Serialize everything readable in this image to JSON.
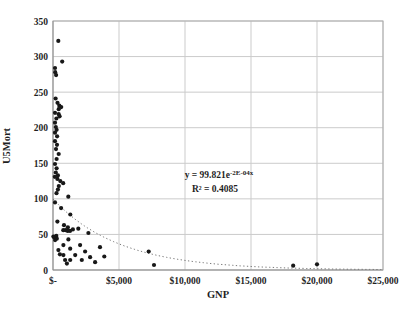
{
  "chart_data": {
    "type": "scatter",
    "title": "",
    "xlabel": "GNP",
    "ylabel": "U5Mort",
    "xlim": [
      0,
      25000
    ],
    "ylim": [
      0,
      350
    ],
    "grid": true,
    "legend": "none",
    "x_ticks": [
      {
        "value": 0,
        "label": "$-"
      },
      {
        "value": 5000,
        "label": "$5,000"
      },
      {
        "value": 10000,
        "label": "$10,000"
      },
      {
        "value": 15000,
        "label": "$15,000"
      },
      {
        "value": 20000,
        "label": "$20,000"
      },
      {
        "value": 25000,
        "label": "$25,000"
      }
    ],
    "y_ticks": [
      {
        "value": 0,
        "label": "0"
      },
      {
        "value": 50,
        "label": "50"
      },
      {
        "value": 100,
        "label": "100"
      },
      {
        "value": 150,
        "label": "150"
      },
      {
        "value": 200,
        "label": "200"
      },
      {
        "value": 250,
        "label": "250"
      },
      {
        "value": 300,
        "label": "300"
      },
      {
        "value": 350,
        "label": "350"
      }
    ],
    "points": [
      [
        400,
        322
      ],
      [
        700,
        293
      ],
      [
        150,
        284
      ],
      [
        165,
        278
      ],
      [
        235,
        274
      ],
      [
        200,
        241
      ],
      [
        340,
        235
      ],
      [
        480,
        231
      ],
      [
        620,
        229
      ],
      [
        430,
        226
      ],
      [
        150,
        221
      ],
      [
        430,
        219
      ],
      [
        500,
        216
      ],
      [
        260,
        213
      ],
      [
        150,
        207
      ],
      [
        210,
        201
      ],
      [
        270,
        197
      ],
      [
        150,
        193
      ],
      [
        310,
        188
      ],
      [
        150,
        181
      ],
      [
        300,
        176
      ],
      [
        230,
        170
      ],
      [
        430,
        163
      ],
      [
        270,
        156
      ],
      [
        150,
        149
      ],
      [
        270,
        143
      ],
      [
        210,
        137
      ],
      [
        370,
        133
      ],
      [
        140,
        131
      ],
      [
        330,
        128
      ],
      [
        550,
        125
      ],
      [
        770,
        122
      ],
      [
        440,
        118
      ],
      [
        370,
        113
      ],
      [
        265,
        108
      ],
      [
        1160,
        103
      ],
      [
        150,
        95
      ],
      [
        610,
        87
      ],
      [
        1310,
        78
      ],
      [
        330,
        68
      ],
      [
        830,
        63
      ],
      [
        1130,
        60
      ],
      [
        1510,
        57
      ],
      [
        780,
        56
      ],
      [
        960,
        56
      ],
      [
        1110,
        55
      ],
      [
        1290,
        55
      ],
      [
        1920,
        58
      ],
      [
        2680,
        52
      ],
      [
        250,
        48
      ],
      [
        100,
        46
      ],
      [
        290,
        44
      ],
      [
        160,
        42
      ],
      [
        1170,
        43
      ],
      [
        30,
        47
      ],
      [
        520,
        22
      ],
      [
        790,
        35
      ],
      [
        2050,
        35
      ],
      [
        1300,
        30
      ],
      [
        410,
        28
      ],
      [
        2430,
        26
      ],
      [
        3560,
        32
      ],
      [
        790,
        21
      ],
      [
        1680,
        21
      ],
      [
        2810,
        18
      ],
      [
        3890,
        19
      ],
      [
        920,
        14
      ],
      [
        1300,
        14
      ],
      [
        2180,
        14
      ],
      [
        3190,
        11
      ],
      [
        1050,
        9
      ],
      [
        7250,
        26
      ],
      [
        7650,
        7
      ],
      [
        18200,
        6
      ],
      [
        20000,
        8
      ]
    ],
    "trendline": {
      "model": "exponential",
      "a": 99.821,
      "b": -0.0002,
      "style": "dotted"
    },
    "annotation": {
      "equation_base": "y = 99.821e",
      "equation_exponent": "-2E-04x",
      "r2": "R² = 0.4085"
    }
  },
  "style": {
    "point_color": "#181818",
    "grid_color": "#cbcbcb",
    "plot_border_color": "#adadad",
    "axis_line_color": "#8f8f8f",
    "trendline_color": "#7a7a7a",
    "text_color": "#1f1f1f",
    "background": "#ffffff"
  }
}
